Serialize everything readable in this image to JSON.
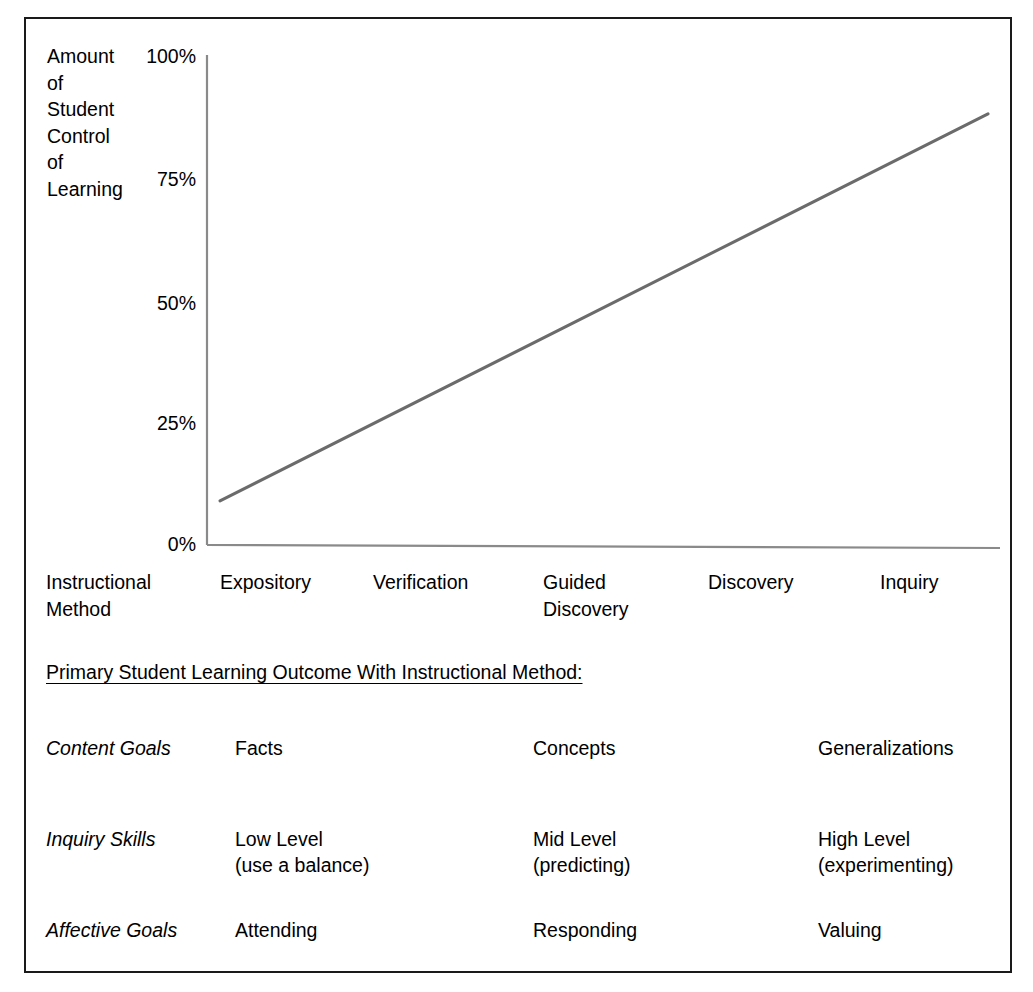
{
  "figure": {
    "border_color": "#1a1a1a",
    "background": "#ffffff",
    "line_color": "#6b6b6b",
    "axis_color": "#808080"
  },
  "chart_data": {
    "type": "line",
    "title": "",
    "xlabel": "Instructional Method",
    "ylabel": "Amount\nof\nStudent\nControl\nof\nLearning",
    "ylim": [
      0,
      100
    ],
    "grid": false,
    "legend": "none",
    "ytick_labels": [
      "100%",
      "75%",
      "50%",
      "25%",
      "0%"
    ],
    "ytick_values": [
      100,
      75,
      50,
      25,
      0
    ],
    "categories": [
      "Expository",
      "Verification",
      "Guided\nDiscovery",
      "Discovery",
      "Inquiry"
    ],
    "x": [
      "Expository",
      "Verification",
      "Guided Discovery",
      "Discovery",
      "Inquiry"
    ],
    "series": [
      {
        "name": "Amount of Student Control of Learning",
        "values": [
          9,
          29,
          49,
          69,
          88
        ]
      }
    ]
  },
  "axis": {
    "y_title": "Amount\nof\nStudent\nControl\nof\nLearning",
    "ticks": [
      {
        "label": "100%"
      },
      {
        "label": "75%"
      },
      {
        "label": "50%"
      },
      {
        "label": "25%"
      },
      {
        "label": "0%"
      }
    ],
    "x_categories": [
      {
        "label": "Instructional\nMethod"
      },
      {
        "label": "Expository"
      },
      {
        "label": "Verification"
      },
      {
        "label": "Guided\nDiscovery"
      },
      {
        "label": "Discovery"
      },
      {
        "label": "Inquiry"
      }
    ]
  },
  "outcomes": {
    "header": "Primary Student Learning Outcome With Instructional Method:",
    "rows": [
      {
        "label": "Content Goals",
        "cells": [
          "Facts",
          "Concepts",
          "Generalizations"
        ]
      },
      {
        "label": "Inquiry Skills",
        "cells": [
          "Low Level\n(use a balance)",
          "Mid Level\n(predicting)",
          "High Level\n(experimenting)"
        ]
      },
      {
        "label": "Affective Goals",
        "cells": [
          "Attending",
          "Responding",
          "Valuing"
        ]
      }
    ]
  }
}
